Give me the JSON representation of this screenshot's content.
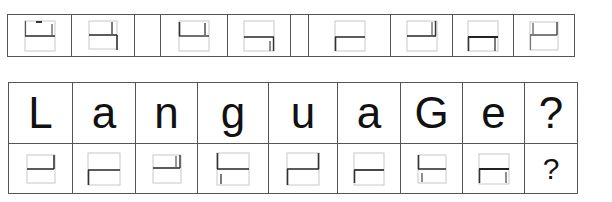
{
  "puzzle": {
    "top_row": {
      "cells": [
        {
          "glyph": "g1"
        },
        {
          "glyph": "g2"
        },
        {
          "glyph": "empty"
        },
        {
          "glyph": "g3"
        },
        {
          "glyph": "g4"
        },
        {
          "glyph": "empty"
        },
        {
          "glyph": "g5"
        },
        {
          "glyph": "g6"
        },
        {
          "glyph": "g7"
        },
        {
          "glyph": "g8"
        }
      ]
    },
    "table": {
      "letters": [
        "L",
        "a",
        "n",
        "g",
        "u",
        "a",
        "G",
        "e",
        "?"
      ],
      "codes": [
        {
          "glyph": "c1"
        },
        {
          "glyph": "c2"
        },
        {
          "glyph": "c3"
        },
        {
          "glyph": "c4"
        },
        {
          "glyph": "c5"
        },
        {
          "glyph": "c6"
        },
        {
          "glyph": "c7"
        },
        {
          "glyph": "c8"
        },
        {
          "text": "?"
        }
      ]
    },
    "colors": {
      "grid_line": "#555555",
      "glyph_box": "#c8c8c8",
      "glyph_stroke": "#333333",
      "text": "#111111"
    }
  }
}
